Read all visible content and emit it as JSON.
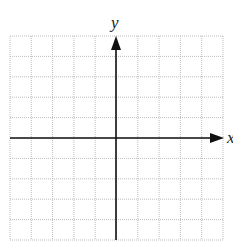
{
  "graph": {
    "grid_cols": 10,
    "grid_rows": 10,
    "x_axis_label": "x",
    "y_axis_label": "y",
    "grid_color": "#b8b8b8",
    "axis_color": "#111111"
  }
}
